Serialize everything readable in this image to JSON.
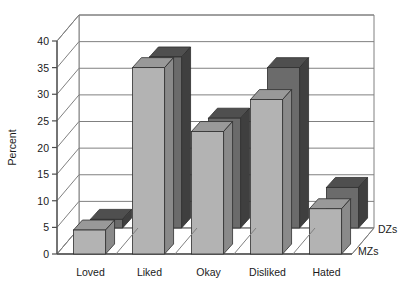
{
  "chart_data": {
    "type": "bar",
    "title": "",
    "subtitle": "",
    "xlabel": "",
    "ylabel": "Percent",
    "categories": [
      "Loved",
      "Liked",
      "Okay",
      "Disliked",
      "Hated"
    ],
    "series": [
      {
        "name": "DZs",
        "values": [
          6.5,
          37,
          25.5,
          35,
          12.5
        ],
        "color": "#6b6b6b"
      },
      {
        "name": "MZs",
        "values": [
          4.5,
          35,
          23,
          29,
          8.5
        ],
        "color": "#b3b3b3"
      }
    ],
    "ylim": [
      0,
      40
    ],
    "yticks": [
      0,
      5,
      10,
      15,
      20,
      25,
      30,
      35,
      40
    ],
    "ytick_labels": [
      "0",
      "5",
      "10",
      "15",
      "20",
      "25",
      "30",
      "35",
      "40"
    ],
    "grid": true,
    "grid_axis": "y",
    "legend_position": "right-bottom",
    "projection": "3d",
    "legend_entries": [
      "DZs",
      "MZs"
    ]
  },
  "axis": {
    "y_label": "Percent",
    "ticks": [
      "0",
      "5",
      "10",
      "15",
      "20",
      "25",
      "30",
      "35",
      "40"
    ]
  },
  "categories": {
    "c0": "Loved",
    "c1": "Liked",
    "c2": "Okay",
    "c3": "Disliked",
    "c4": "Hated"
  },
  "legend": {
    "back": "DZs",
    "front": "MZs"
  },
  "colors": {
    "back_front_face": "#6b6b6b",
    "back_top_face": "#4f4f4f",
    "back_side_face": "#3f3f3f",
    "front_front_face": "#b3b3b3",
    "front_top_face": "#999999",
    "front_side_face": "#8a8a8a",
    "grid": "#808080",
    "axis": "#4d4d4d",
    "floor": "#ffffff",
    "background": "#ffffff"
  }
}
